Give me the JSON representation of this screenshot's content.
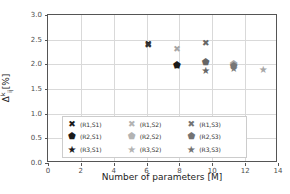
{
  "chart_data": {
    "type": "scatter",
    "title": "",
    "xlabel": "Number of parameters [M]",
    "ylabel": "Δ̅ᵏᵢⱼ [%]",
    "ylabel_parts": {
      "delta": "Δ",
      "sup": "k",
      "sub": "ij",
      "unit": "[%]"
    },
    "xlim": [
      0,
      14
    ],
    "ylim": [
      0.0,
      3.0
    ],
    "xticks": [
      "0",
      "2",
      "4",
      "6",
      "8",
      "10",
      "12",
      "14"
    ],
    "xtick_values": [
      0,
      2,
      4,
      6,
      8,
      10,
      12,
      14
    ],
    "yticks": [
      "0.0",
      "0.5",
      "1.0",
      "1.5",
      "2.0",
      "2.5",
      "3.0"
    ],
    "ytick_values": [
      0.0,
      0.5,
      1.0,
      1.5,
      2.0,
      2.5,
      3.0
    ],
    "grid": true,
    "legend_position": "lower center",
    "series": [
      {
        "name": "(R1,S1)",
        "marker": "square-x",
        "color": "#1a1a1a",
        "points": [
          {
            "x": 6.1,
            "y": 2.41
          }
        ]
      },
      {
        "name": "(R2,S1)",
        "marker": "diamond",
        "color": "#1a1a1a",
        "points": [
          {
            "x": 7.85,
            "y": 1.98
          }
        ]
      },
      {
        "name": "(R3,S1)",
        "marker": "star",
        "color": "#1a1a1a",
        "points": [
          {
            "x": 7.85,
            "y": 1.97
          }
        ]
      },
      {
        "name": "(R1,S2)",
        "marker": "square-x",
        "color": "#a6a6a6",
        "points": [
          {
            "x": 7.85,
            "y": 2.32
          }
        ]
      },
      {
        "name": "(R2,S2)",
        "marker": "diamond",
        "color": "#a6a6a6",
        "points": [
          {
            "x": 11.3,
            "y": 2.01
          }
        ]
      },
      {
        "name": "(R3,S2)",
        "marker": "star",
        "color": "#a6a6a6",
        "points": [
          {
            "x": 13.1,
            "y": 1.89
          }
        ]
      },
      {
        "name": "(R1,S3)",
        "marker": "square-x",
        "color": "#666666",
        "points": [
          {
            "x": 9.6,
            "y": 2.44
          }
        ]
      },
      {
        "name": "(R2,S3)",
        "marker": "diamond",
        "color": "#666666",
        "points": [
          {
            "x": 9.6,
            "y": 2.05
          }
        ]
      },
      {
        "name": "(R3,S3)",
        "marker": "star",
        "color": "#666666",
        "points": [
          {
            "x": 9.6,
            "y": 1.87
          }
        ]
      }
    ],
    "extra_points": [
      {
        "series": "(R1,S1)",
        "x": 6.1,
        "y": 2.4,
        "marker": "square-x",
        "color": "#333333"
      },
      {
        "series": "(R2,S2)",
        "x": 11.3,
        "y": 1.96,
        "marker": "diamond",
        "color": "#777777"
      },
      {
        "series": "(R3,S2)",
        "x": 11.3,
        "y": 1.9,
        "marker": "star",
        "color": "#777777"
      }
    ]
  },
  "legend": {
    "entries": [
      {
        "label": "(R1,S1)",
        "glyph": "✖",
        "color": "#1a1a1a",
        "cls": "m-sq"
      },
      {
        "label": "(R1,S2)",
        "glyph": "✖",
        "color": "#b3b3b3",
        "cls": "m-sq"
      },
      {
        "label": "(R1,S3)",
        "glyph": "✖",
        "color": "#737373",
        "cls": "m-sq"
      },
      {
        "label": "(R2,S1)",
        "glyph": "⬟",
        "color": "#1a1a1a",
        "cls": "m-di"
      },
      {
        "label": "(R2,S2)",
        "glyph": "⬟",
        "color": "#b3b3b3",
        "cls": "m-di"
      },
      {
        "label": "(R2,S3)",
        "glyph": "⬟",
        "color": "#737373",
        "cls": "m-di"
      },
      {
        "label": "(R3,S1)",
        "glyph": "★",
        "color": "#1a1a1a",
        "cls": "m-st"
      },
      {
        "label": "(R3,S2)",
        "glyph": "★",
        "color": "#b3b3b3",
        "cls": "m-st"
      },
      {
        "label": "(R3,S3)",
        "glyph": "★",
        "color": "#737373",
        "cls": "m-st"
      }
    ]
  }
}
